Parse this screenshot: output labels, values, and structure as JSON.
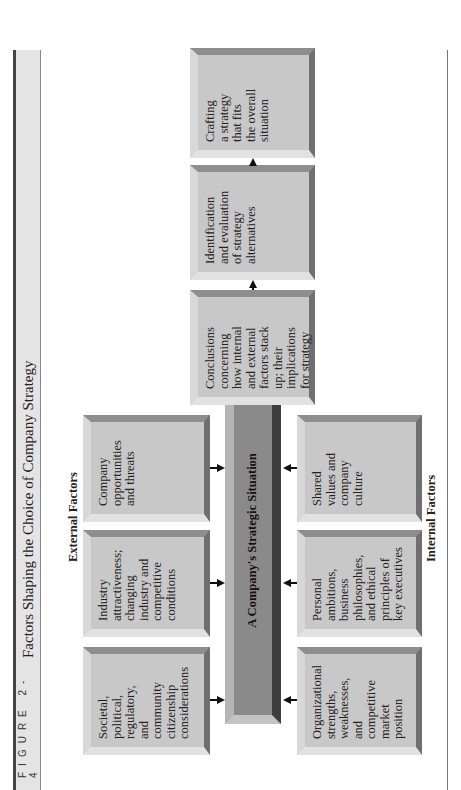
{
  "figure": {
    "label": "FIGURE 2-4",
    "title": "Factors Shaping the Choice of Company Strategy"
  },
  "groups": {
    "external_label": "External Factors",
    "internal_label": "Internal Factors"
  },
  "external_factors": [
    {
      "text": "Societal,\npolitical,\nregulatory,\nand community\ncitizenship\nconsiderations"
    },
    {
      "text": "Industry\nattractiveness;\nchanging\nindustry and\ncompetitive\nconditions"
    },
    {
      "text": "Company\nopportunities\nand threats"
    }
  ],
  "internal_factors": [
    {
      "text": "Organizational\nstrengths,\nweaknesses,\nand competitive\nmarket position"
    },
    {
      "text": "Personal\nambitions,\nbusiness\nphilosophies,\nand ethical\nprinciples of\nkey executives"
    },
    {
      "text": "Shared\nvalues and\ncompany\nculture"
    }
  ],
  "center": {
    "text": "A Company's Strategic Situation"
  },
  "flow": [
    {
      "text": "Conclusions\nconcerning\nhow internal\nand external\nfactors stack\nup; their\nimplications\nfor strategy"
    },
    {
      "text": "Identification\nand evaluation\nof strategy\nalternatives"
    },
    {
      "text": "Crafting\na strategy\nthat fits\nthe overall\nsituation"
    }
  ],
  "colors": {
    "box_fill": "#c8c8c8",
    "center_fill": "#8a8a8a",
    "header_fill": "#e4e4e4"
  }
}
